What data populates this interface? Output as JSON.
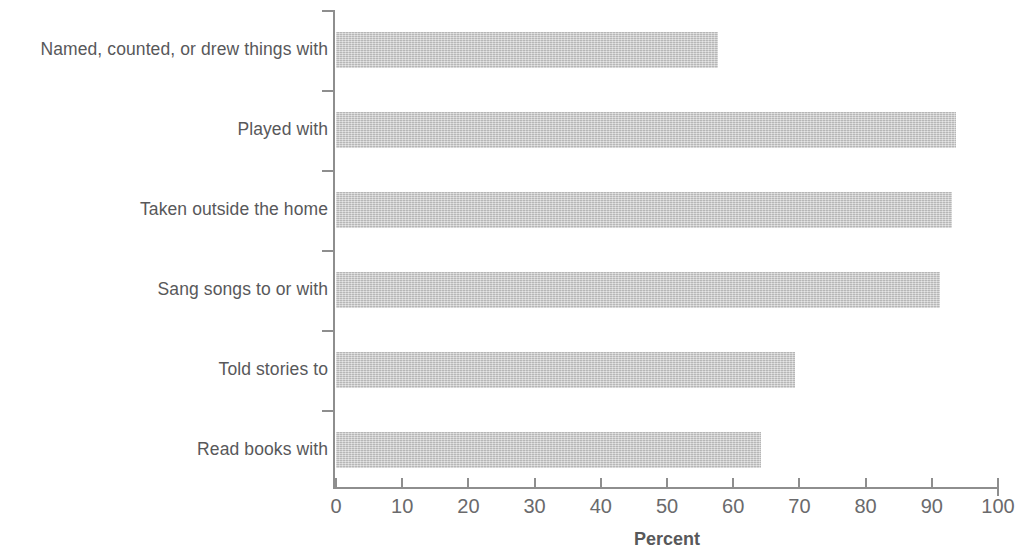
{
  "chart_data": {
    "type": "bar",
    "orientation": "horizontal",
    "title": "",
    "subtitle": "",
    "xlabel": "Percent",
    "ylabel": "",
    "xlim": [
      0,
      100
    ],
    "xticks": [
      "0",
      "10",
      "20",
      "30",
      "40",
      "50",
      "60",
      "70",
      "80",
      "90",
      "100"
    ],
    "grid": false,
    "legend": null,
    "categories": [
      "Named, counted, or drew things with",
      "Played with",
      "Taken outside the home",
      "Sang songs to or with",
      "Told stories to",
      "Read books with"
    ],
    "values": [
      57.7,
      93.7,
      93.1,
      91.2,
      69.3,
      64.2
    ],
    "bar_color": "#c9c9c9",
    "axis_color": "#8e8e8e",
    "text_color": "#58585a"
  }
}
